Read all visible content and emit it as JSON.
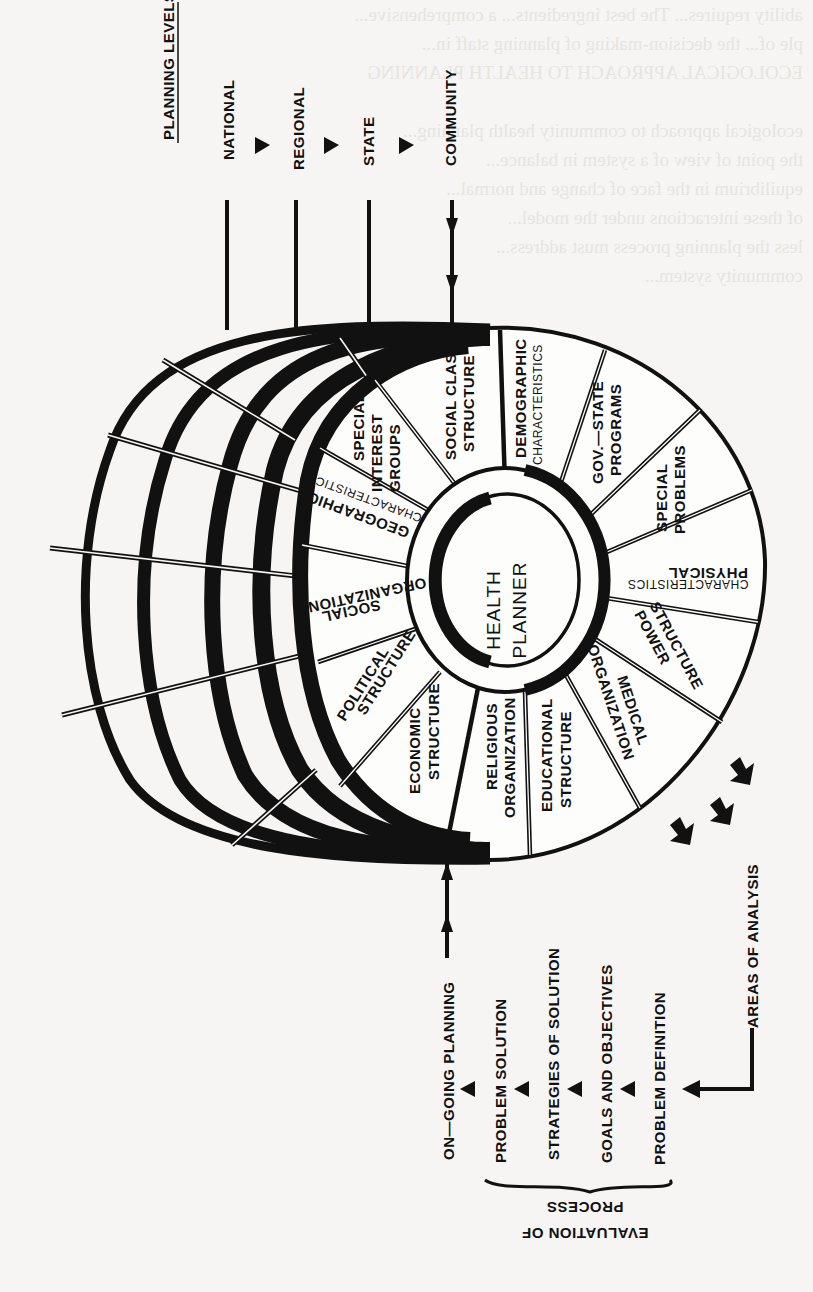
{
  "figure": {
    "center_label": [
      "HEALTH",
      "PLANNER"
    ],
    "planning_levels": {
      "heading": "PLANNING LEVELS",
      "levels": [
        "NATIONAL",
        "REGIONAL",
        "STATE",
        "COMMUNITY"
      ]
    },
    "areas_of_analysis": {
      "heading": "AREAS OF ANALYSIS",
      "segments": [
        {
          "line1": "SOCIAL CLASS",
          "line2": "STRUCTURE"
        },
        {
          "line1": "DEMOGRAPHIC",
          "line2": "CHARACTERISTICS"
        },
        {
          "line1": "GOV.—STATE",
          "line2": "PROGRAMS"
        },
        {
          "line1": "SPECIAL",
          "line2": "PROBLEMS"
        },
        {
          "line1": "PHYSICAL",
          "line2": "CHARACTERISTICS"
        },
        {
          "line1": "POWER",
          "line2": "STRUCTURE"
        },
        {
          "line1": "MEDICAL",
          "line2": "ORGANIZATION"
        },
        {
          "line1": "EDUCATIONAL",
          "line2": "STRUCTURE"
        },
        {
          "line1": "RELIGIOUS",
          "line2": "ORGANIZATION"
        },
        {
          "line1": "ECONOMIC",
          "line2": "STRUCTURE"
        },
        {
          "line1": "POLITICAL",
          "line2": "STRUCTURE"
        },
        {
          "line1": "SOCIAL",
          "line2": "ORGANIZATION"
        },
        {
          "line1": "GEOGRAPHIC",
          "line2": "CHARACTERISTICS"
        },
        {
          "line1": "SPECIAL",
          "line2": "INTEREST",
          "line3": "GROUPS"
        }
      ]
    },
    "process": {
      "steps": [
        "ON—GOING PLANNING",
        "PROBLEM SOLUTION",
        "STRATEGIES OF SOLUTION",
        "GOALS AND OBJECTIVES",
        "PROBLEM DEFINITION"
      ],
      "brace_label": [
        "PROCESS",
        "EVALUATION OF"
      ]
    }
  },
  "background_bleed_text": [
    "ability requires... The best ingredients... a comprehensive...",
    "ple of... the decision-making of planning staff in...",
    "",
    "ECOLOGICAL APPROACH TO HEALTH PLANNING",
    "",
    "ecological approach to community health planning...",
    "the point of view of a system in balance...",
    "equilibrium in the face of change and normal...",
    "of these interactions under the model...",
    "less the planning process must address...",
    "community system...",
    "",
    "",
    "",
    "",
    "",
    "",
    "",
    "",
    "",
    "",
    "",
    "",
    "",
    "",
    "",
    "",
    "",
    "",
    "",
    "",
    "",
    "",
    "",
    "",
    "",
    "",
    "",
    "",
    "",
    "",
    "",
    "",
    "",
    ""
  ]
}
